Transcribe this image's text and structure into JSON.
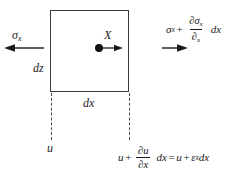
{
  "figure": {
    "colors": {
      "stroke": "#3a3a3a",
      "dashed": "#4a4a4a",
      "text": "#1a1a1a",
      "dot": "#111111",
      "background": "#ffffff"
    }
  },
  "element": {
    "width_label": "dx",
    "height_label": "dz"
  },
  "labels": {
    "sigma_left": "σ",
    "sigma_left_sub": "x",
    "body_force": "X",
    "displacement_left": "u"
  },
  "sigma_right": {
    "base": "σ",
    "base_sub": "x",
    "plus": "+",
    "numerator": "∂σ",
    "numerator_sub": "x",
    "denominator": "∂",
    "denominator_sub": "x",
    "trailing": "dx"
  },
  "strain_equation": {
    "base": "u",
    "plus": "+",
    "numerator": "∂u",
    "denominator": "∂x",
    "trailing": "dx",
    "equals": "=",
    "rhs_base": "u",
    "rhs_plus": "+",
    "rhs_strain": "ε",
    "rhs_strain_sub": "x",
    "rhs_trailing": "dx"
  },
  "arrows": {
    "left_stress": "arrow-left",
    "right_stress": "arrow-right",
    "body_force": "arrow-right-small"
  }
}
